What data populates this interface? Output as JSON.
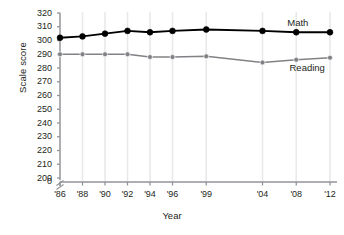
{
  "chart_data": {
    "type": "line",
    "title": "",
    "xlabel": "Year",
    "ylabel": "Scale score",
    "categories": [
      "'86",
      "'88",
      "'90",
      "'92",
      "'94",
      "'96",
      "'99",
      "'04",
      "'08",
      "'12"
    ],
    "x_positions": [
      0,
      1,
      2,
      3,
      4,
      5,
      6.5,
      9,
      10.5,
      12
    ],
    "ylim": [
      200,
      320
    ],
    "y_ticks": [
      200,
      210,
      220,
      230,
      240,
      250,
      260,
      270,
      280,
      290,
      300,
      310,
      320
    ],
    "y_axis_break": true,
    "y_zero_label": "0",
    "grid": "vertical-only",
    "legend": "inline-labels",
    "series": [
      {
        "name": "Math",
        "color": "#000000",
        "values": [
          302,
          303,
          305,
          307,
          306,
          307,
          308,
          307,
          306,
          306
        ],
        "label_x": 10.1,
        "label_y": 313
      },
      {
        "name": "Reading",
        "color": "#808285",
        "values": [
          290,
          290,
          290,
          290,
          288,
          288,
          288.5,
          284,
          286,
          287.5
        ],
        "label_x": 10.2,
        "label_y": 280
      }
    ]
  }
}
